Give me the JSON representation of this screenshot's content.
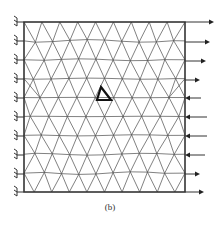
{
  "figure": {
    "caption": "(b)",
    "type": "finite-element triangular mesh",
    "frame": {
      "left": 24,
      "top": 22,
      "right": 185,
      "bottom": 192
    },
    "colors": {
      "line": "#4a4a4a",
      "frame": "#333333",
      "highlight": "#111111",
      "background": "#ffffff"
    },
    "left_boundary": {
      "condition": "fixed-support",
      "support_y": [
        22,
        41,
        60,
        79,
        98,
        117,
        136,
        155,
        174,
        192
      ]
    },
    "right_boundary": {
      "loads": [
        {
          "y": 22,
          "direction": "right",
          "length": 22
        },
        {
          "y": 42,
          "direction": "right",
          "length": 18
        },
        {
          "y": 61,
          "direction": "right",
          "length": 14
        },
        {
          "y": 80,
          "direction": "right",
          "length": 8
        },
        {
          "y": 98,
          "direction": "left",
          "length": 8
        },
        {
          "y": 117,
          "direction": "left",
          "length": 14
        },
        {
          "y": 136,
          "direction": "left",
          "length": 14
        },
        {
          "y": 155,
          "direction": "left",
          "length": 12
        },
        {
          "y": 174,
          "direction": "right",
          "length": 8
        },
        {
          "y": 192,
          "direction": "right",
          "length": 12
        }
      ]
    },
    "highlighted_element": {
      "points": [
        [
          101,
          87
        ],
        [
          111,
          100
        ],
        [
          97,
          100
        ]
      ],
      "label": "bold-triangle"
    }
  }
}
